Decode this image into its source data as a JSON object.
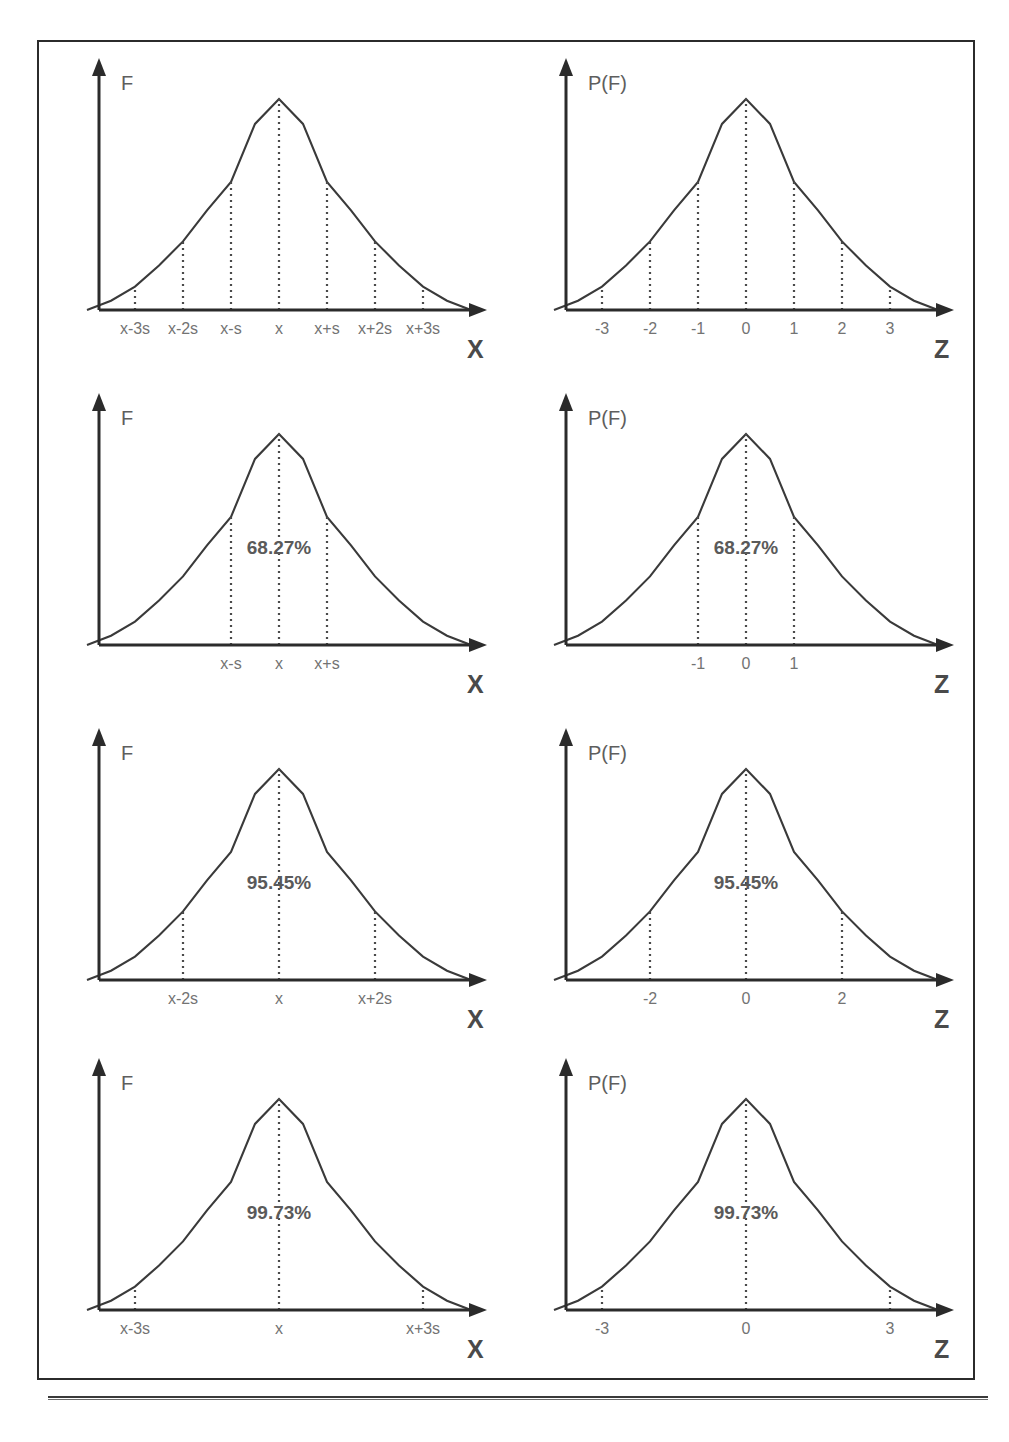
{
  "figure": {
    "caption": "",
    "axis_color": "#2b2b2b",
    "curve_color": "#3a3a3a",
    "label_color": "#6e6e6e"
  },
  "chart_data": [
    {
      "id": "panel-1-raw",
      "type": "line",
      "title": "",
      "ylabel": "F",
      "xlabel": "X",
      "distribution": "normal",
      "mean": 0,
      "sd": 1,
      "xlim": [
        -4.0,
        4.0
      ],
      "ylim": [
        0,
        1
      ],
      "grid": false,
      "legend": "none",
      "tick_values": [
        -3,
        -2,
        -1,
        0,
        1,
        2,
        3
      ],
      "tick_labels": [
        "x-3s",
        "x-2s",
        "x-s",
        "x",
        "x+s",
        "x+2s",
        "x+3s"
      ],
      "annotation": "",
      "x": [
        -4.0,
        -3.5,
        -3.0,
        -2.5,
        -2.0,
        -1.5,
        -1.0,
        -0.5,
        0.0,
        0.5,
        1.0,
        1.5,
        2.0,
        2.5,
        3.0,
        3.5,
        4.0
      ],
      "y": [
        0.0,
        0.044,
        0.111,
        0.211,
        0.325,
        0.472,
        0.607,
        0.882,
        1.0,
        0.882,
        0.607,
        0.472,
        0.325,
        0.211,
        0.111,
        0.044,
        0.0
      ]
    },
    {
      "id": "panel-1-standard",
      "type": "line",
      "title": "",
      "ylabel": "P(F)",
      "xlabel": "Z",
      "distribution": "normal",
      "mean": 0,
      "sd": 1,
      "xlim": [
        -4.0,
        4.0
      ],
      "ylim": [
        0,
        1
      ],
      "grid": false,
      "legend": "none",
      "tick_values": [
        -3,
        -2,
        -1,
        0,
        1,
        2,
        3
      ],
      "tick_labels": [
        "-3",
        "-2",
        "-1",
        "0",
        "1",
        "2",
        "3"
      ],
      "annotation": "",
      "x": [
        -4.0,
        -3.5,
        -3.0,
        -2.5,
        -2.0,
        -1.5,
        -1.0,
        -0.5,
        0.0,
        0.5,
        1.0,
        1.5,
        2.0,
        2.5,
        3.0,
        3.5,
        4.0
      ],
      "y": [
        0.0,
        0.044,
        0.111,
        0.211,
        0.325,
        0.472,
        0.607,
        0.882,
        1.0,
        0.882,
        0.607,
        0.472,
        0.325,
        0.211,
        0.111,
        0.044,
        0.0
      ]
    },
    {
      "id": "panel-2-raw",
      "type": "line",
      "title": "",
      "ylabel": "F",
      "xlabel": "X",
      "distribution": "normal",
      "mean": 0,
      "sd": 1,
      "xlim": [
        -4.0,
        4.0
      ],
      "ylim": [
        0,
        1
      ],
      "grid": false,
      "legend": "none",
      "tick_values": [
        -1,
        0,
        1
      ],
      "tick_labels": [
        "x-s",
        "x",
        "x+s"
      ],
      "annotation": "68.27%",
      "annotation_interval": [
        -1,
        1
      ],
      "x": [
        -4.0,
        -3.5,
        -3.0,
        -2.5,
        -2.0,
        -1.5,
        -1.0,
        -0.5,
        0.0,
        0.5,
        1.0,
        1.5,
        2.0,
        2.5,
        3.0,
        3.5,
        4.0
      ],
      "y": [
        0.0,
        0.044,
        0.111,
        0.211,
        0.325,
        0.472,
        0.607,
        0.882,
        1.0,
        0.882,
        0.607,
        0.472,
        0.325,
        0.211,
        0.111,
        0.044,
        0.0
      ]
    },
    {
      "id": "panel-2-standard",
      "type": "line",
      "title": "",
      "ylabel": "P(F)",
      "xlabel": "Z",
      "distribution": "normal",
      "mean": 0,
      "sd": 1,
      "xlim": [
        -4.0,
        4.0
      ],
      "ylim": [
        0,
        1
      ],
      "grid": false,
      "legend": "none",
      "tick_values": [
        -1,
        0,
        1
      ],
      "tick_labels": [
        "-1",
        "0",
        "1"
      ],
      "annotation": "68.27%",
      "annotation_interval": [
        -1,
        1
      ],
      "x": [
        -4.0,
        -3.5,
        -3.0,
        -2.5,
        -2.0,
        -1.5,
        -1.0,
        -0.5,
        0.0,
        0.5,
        1.0,
        1.5,
        2.0,
        2.5,
        3.0,
        3.5,
        4.0
      ],
      "y": [
        0.0,
        0.044,
        0.111,
        0.211,
        0.325,
        0.472,
        0.607,
        0.882,
        1.0,
        0.882,
        0.607,
        0.472,
        0.325,
        0.211,
        0.111,
        0.044,
        0.0
      ]
    },
    {
      "id": "panel-3-raw",
      "type": "line",
      "title": "",
      "ylabel": "F",
      "xlabel": "X",
      "distribution": "normal",
      "mean": 0,
      "sd": 1,
      "xlim": [
        -4.0,
        4.0
      ],
      "ylim": [
        0,
        1
      ],
      "grid": false,
      "legend": "none",
      "tick_values": [
        -2,
        0,
        2
      ],
      "tick_labels": [
        "x-2s",
        "x",
        "x+2s"
      ],
      "annotation": "95.45%",
      "annotation_interval": [
        -2,
        2
      ],
      "x": [
        -4.0,
        -3.5,
        -3.0,
        -2.5,
        -2.0,
        -1.5,
        -1.0,
        -0.5,
        0.0,
        0.5,
        1.0,
        1.5,
        2.0,
        2.5,
        3.0,
        3.5,
        4.0
      ],
      "y": [
        0.0,
        0.044,
        0.111,
        0.211,
        0.325,
        0.472,
        0.607,
        0.882,
        1.0,
        0.882,
        0.607,
        0.472,
        0.325,
        0.211,
        0.111,
        0.044,
        0.0
      ]
    },
    {
      "id": "panel-3-standard",
      "type": "line",
      "title": "",
      "ylabel": "P(F)",
      "xlabel": "Z",
      "distribution": "normal",
      "mean": 0,
      "sd": 1,
      "xlim": [
        -4.0,
        4.0
      ],
      "ylim": [
        0,
        1
      ],
      "grid": false,
      "legend": "none",
      "tick_values": [
        -2,
        0,
        2
      ],
      "tick_labels": [
        "-2",
        "0",
        "2"
      ],
      "annotation": "95.45%",
      "annotation_interval": [
        -2,
        2
      ],
      "x": [
        -4.0,
        -3.5,
        -3.0,
        -2.5,
        -2.0,
        -1.5,
        -1.0,
        -0.5,
        0.0,
        0.5,
        1.0,
        1.5,
        2.0,
        2.5,
        3.0,
        3.5,
        4.0
      ],
      "y": [
        0.0,
        0.044,
        0.111,
        0.211,
        0.325,
        0.472,
        0.607,
        0.882,
        1.0,
        0.882,
        0.607,
        0.472,
        0.325,
        0.211,
        0.111,
        0.044,
        0.0
      ]
    },
    {
      "id": "panel-4-raw",
      "type": "line",
      "title": "",
      "ylabel": "F",
      "xlabel": "X",
      "distribution": "normal",
      "mean": 0,
      "sd": 1,
      "xlim": [
        -4.0,
        4.0
      ],
      "ylim": [
        0,
        1
      ],
      "grid": false,
      "legend": "none",
      "tick_values": [
        -3,
        0,
        3
      ],
      "tick_labels": [
        "x-3s",
        "x",
        "x+3s"
      ],
      "annotation": "99.73%",
      "annotation_interval": [
        -3,
        3
      ],
      "x": [
        -4.0,
        -3.5,
        -3.0,
        -2.5,
        -2.0,
        -1.5,
        -1.0,
        -0.5,
        0.0,
        0.5,
        1.0,
        1.5,
        2.0,
        2.5,
        3.0,
        3.5,
        4.0
      ],
      "y": [
        0.0,
        0.044,
        0.111,
        0.211,
        0.325,
        0.472,
        0.607,
        0.882,
        1.0,
        0.882,
        0.607,
        0.472,
        0.325,
        0.211,
        0.111,
        0.044,
        0.0
      ]
    },
    {
      "id": "panel-4-standard",
      "type": "line",
      "title": "",
      "ylabel": "P(F)",
      "xlabel": "Z",
      "distribution": "normal",
      "mean": 0,
      "sd": 1,
      "xlim": [
        -4.0,
        4.0
      ],
      "ylim": [
        0,
        1
      ],
      "grid": false,
      "legend": "none",
      "tick_values": [
        -3,
        0,
        3
      ],
      "tick_labels": [
        "-3",
        "0",
        "3"
      ],
      "annotation": "99.73%",
      "annotation_interval": [
        -3,
        3
      ],
      "x": [
        -4.0,
        -3.5,
        -3.0,
        -2.5,
        -2.0,
        -1.5,
        -1.0,
        -0.5,
        0.0,
        0.5,
        1.0,
        1.5,
        2.0,
        2.5,
        3.0,
        3.5,
        4.0
      ],
      "y": [
        0.0,
        0.044,
        0.111,
        0.211,
        0.325,
        0.472,
        0.607,
        0.882,
        1.0,
        0.882,
        0.607,
        0.472,
        0.325,
        0.211,
        0.111,
        0.044,
        0.0
      ]
    }
  ]
}
